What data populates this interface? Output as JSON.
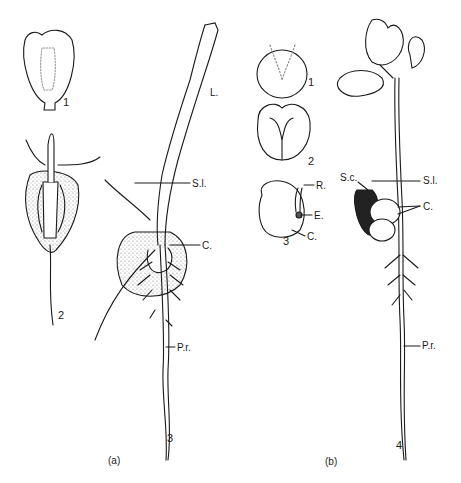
{
  "figure": {
    "panels": [
      {
        "caption": "(a)",
        "stages": [
          "1",
          "2",
          "3"
        ],
        "labels": {
          "leaf": "L.",
          "soil_level": "S.l.",
          "cotyledon": "C.",
          "primary_root": "P.r."
        }
      },
      {
        "caption": "(b)",
        "stages": [
          "1",
          "2",
          "3",
          "4"
        ],
        "labels": {
          "radicle": "R.",
          "embryo": "E.",
          "cotyledon_seed": "C.",
          "seed_coat": "S.c.",
          "soil_level": "S.l.",
          "cotyledons": "C.",
          "primary_root": "P.r."
        }
      }
    ]
  }
}
